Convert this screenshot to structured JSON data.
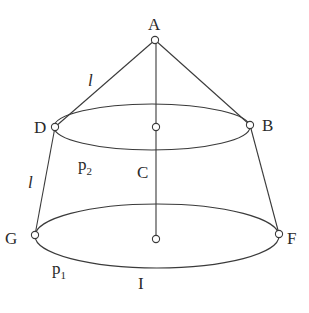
{
  "diagram": {
    "type": "truncated-cone-geometry",
    "colors": {
      "line": "#3a3a3a",
      "text": "#2a2a2a",
      "background": "#ffffff"
    },
    "points": {
      "A": {
        "label": "A",
        "x": 155,
        "y": 40
      },
      "D": {
        "label": "D",
        "x": 55,
        "y": 127
      },
      "B": {
        "label": "B",
        "x": 250,
        "y": 125
      },
      "top_center": {
        "label": "",
        "x": 156,
        "y": 127
      },
      "G": {
        "label": "G",
        "x": 35,
        "y": 235
      },
      "F": {
        "label": "F",
        "x": 279,
        "y": 234
      },
      "bottom_center": {
        "label": "",
        "x": 156,
        "y": 239
      }
    },
    "labels": {
      "A": "A",
      "B": "B",
      "C": "C",
      "D": "D",
      "F": "F",
      "G": "G",
      "I": "I",
      "l_upper": "l",
      "l_lower": "l",
      "p2_base": "p",
      "p2_sub": "2",
      "p1_base": "p",
      "p1_sub": "1"
    },
    "edges": [
      {
        "from": "A",
        "to": "D",
        "label": "l"
      },
      {
        "from": "A",
        "to": "B"
      },
      {
        "from": "A",
        "to": "bottom_center"
      },
      {
        "from": "D",
        "to": "G",
        "label": "l"
      },
      {
        "from": "B",
        "to": "F"
      }
    ],
    "ellipses": [
      {
        "name": "top-circle",
        "label": "p2",
        "cx": 152,
        "cy": 127,
        "rx": 98,
        "ry": 23
      },
      {
        "name": "bottom-circle",
        "label": "p1",
        "cx": 157,
        "cy": 236,
        "rx": 122,
        "ry": 32
      }
    ]
  }
}
